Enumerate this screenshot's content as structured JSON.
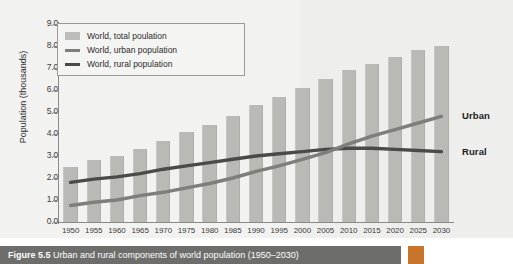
{
  "chart_data": {
    "type": "bar",
    "title": "",
    "xlabel": "",
    "ylabel": "Population (thousands)",
    "ylim": [
      0.0,
      9.0
    ],
    "yticks": [
      "0.0",
      "1.0",
      "2.0",
      "3.0",
      "4.0",
      "5.0",
      "6.0",
      "7.0",
      "8.0",
      "9.0"
    ],
    "grid": false,
    "legend_position": "top-left",
    "categories": [
      "1950",
      "1955",
      "1960",
      "1965",
      "1970",
      "1975",
      "1980",
      "1985",
      "1990",
      "1995",
      "2000",
      "2005",
      "2010",
      "2015",
      "2020",
      "2025",
      "2030"
    ],
    "series": [
      {
        "name": "World, total poulation",
        "kind": "bar",
        "values": [
          2.5,
          2.8,
          3.0,
          3.3,
          3.7,
          4.1,
          4.4,
          4.8,
          5.3,
          5.7,
          6.1,
          6.5,
          6.9,
          7.2,
          7.5,
          7.8,
          8.0
        ]
      },
      {
        "name": "World, urban population",
        "kind": "line",
        "values": [
          0.75,
          0.9,
          1.0,
          1.2,
          1.35,
          1.55,
          1.75,
          2.0,
          2.3,
          2.55,
          2.85,
          3.15,
          3.55,
          3.9,
          4.2,
          4.5,
          4.8
        ]
      },
      {
        "name": "World, rural population",
        "kind": "line",
        "values": [
          1.8,
          1.95,
          2.05,
          2.2,
          2.4,
          2.55,
          2.7,
          2.85,
          3.0,
          3.1,
          3.2,
          3.3,
          3.35,
          3.35,
          3.3,
          3.25,
          3.2
        ]
      }
    ],
    "annotations": [
      {
        "text": "Urban",
        "series": "World, urban population"
      },
      {
        "text": "Rural",
        "series": "World, rural population"
      }
    ],
    "colors": {
      "bar": "#b9b9b5",
      "urban": "#7e7e7a",
      "rural": "#4a4a48",
      "panel_background": "#f2f2f0",
      "axis": "#8a8a86",
      "caption_bar": "#6d6d6b",
      "caption_accent": "#c8742a"
    }
  },
  "legend": {
    "items": [
      {
        "label": "World, total poulation"
      },
      {
        "label": "World, urban population"
      },
      {
        "label": "World, rural population"
      }
    ]
  },
  "caption": {
    "label": "Figure 5.5",
    "text": "Urban and rural components of world population (1950–2030)"
  }
}
